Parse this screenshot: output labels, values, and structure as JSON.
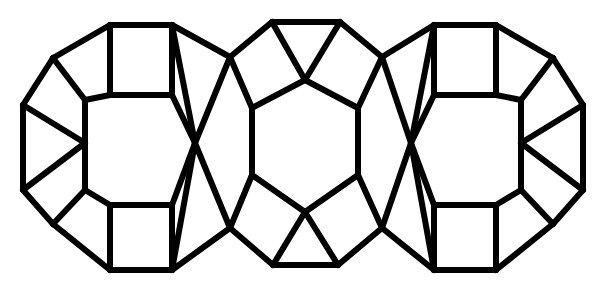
{
  "figure": {
    "width": 606,
    "height": 281,
    "background_color": "#ffffff",
    "stroke_color": "#000000",
    "stroke_width": 6,
    "units_count": 3
  },
  "units": [
    {
      "name": "left-polyhedron",
      "orientation": "upright",
      "center_x": 148,
      "center_y": 140
    },
    {
      "name": "center-polyhedron",
      "orientation": "rotated",
      "center_x": 305,
      "center_y": 140
    },
    {
      "name": "right-polyhedron",
      "orientation": "upright",
      "center_x": 458,
      "center_y": 140
    }
  ],
  "chart_data": {
    "type": "diagram",
    "xlabel": "",
    "ylabel": "",
    "edges": [
      [
        53,
        58,
        110,
        25
      ],
      [
        110,
        25,
        172,
        25
      ],
      [
        172,
        25,
        230,
        57
      ],
      [
        23,
        105,
        53,
        58
      ],
      [
        23,
        105,
        23,
        190
      ],
      [
        23,
        190,
        53,
        224
      ],
      [
        53,
        224,
        110,
        270
      ],
      [
        110,
        270,
        172,
        270
      ],
      [
        172,
        270,
        230,
        228
      ],
      [
        110,
        25,
        110,
        95
      ],
      [
        172,
        25,
        172,
        95
      ],
      [
        110,
        95,
        172,
        95
      ],
      [
        110,
        205,
        172,
        205
      ],
      [
        110,
        205,
        110,
        270
      ],
      [
        172,
        205,
        172,
        270
      ],
      [
        53,
        58,
        85,
        100
      ],
      [
        85,
        100,
        110,
        95
      ],
      [
        85,
        100,
        85,
        190
      ],
      [
        85,
        190,
        110,
        205
      ],
      [
        85,
        190,
        53,
        224
      ],
      [
        23,
        105,
        85,
        143
      ],
      [
        23,
        190,
        85,
        143
      ],
      [
        85,
        100,
        85,
        143
      ],
      [
        85,
        143,
        85,
        190
      ],
      [
        172,
        95,
        195,
        143
      ],
      [
        195,
        143,
        172,
        205
      ],
      [
        172,
        25,
        195,
        143
      ],
      [
        195,
        143,
        172,
        270
      ],
      [
        230,
        57,
        195,
        143
      ],
      [
        195,
        143,
        230,
        228
      ],
      [
        230,
        57,
        252,
        108
      ],
      [
        230,
        228,
        252,
        175
      ],
      [
        272,
        22,
        230,
        57
      ],
      [
        272,
        22,
        340,
        22
      ],
      [
        340,
        22,
        382,
        57
      ],
      [
        273,
        265,
        230,
        228
      ],
      [
        273,
        265,
        338,
        265
      ],
      [
        338,
        265,
        382,
        228
      ],
      [
        272,
        22,
        305,
        80
      ],
      [
        340,
        22,
        305,
        80
      ],
      [
        273,
        265,
        305,
        212
      ],
      [
        338,
        265,
        305,
        212
      ],
      [
        305,
        80,
        252,
        108
      ],
      [
        252,
        108,
        252,
        175
      ],
      [
        252,
        175,
        305,
        212
      ],
      [
        305,
        212,
        358,
        175
      ],
      [
        358,
        175,
        358,
        108
      ],
      [
        358,
        108,
        305,
        80
      ],
      [
        382,
        57,
        358,
        108
      ],
      [
        382,
        228,
        358,
        175
      ],
      [
        411,
        143,
        382,
        57
      ],
      [
        411,
        143,
        382,
        228
      ],
      [
        411,
        143,
        434,
        95
      ],
      [
        411,
        143,
        434,
        205
      ],
      [
        411,
        143,
        434,
        25
      ],
      [
        411,
        143,
        434,
        270
      ],
      [
        434,
        25,
        496,
        25
      ],
      [
        496,
        25,
        553,
        58
      ],
      [
        434,
        270,
        496,
        270
      ],
      [
        496,
        270,
        553,
        224
      ],
      [
        434,
        25,
        434,
        95
      ],
      [
        496,
        25,
        496,
        95
      ],
      [
        434,
        95,
        496,
        95
      ],
      [
        434,
        205,
        496,
        205
      ],
      [
        434,
        205,
        434,
        270
      ],
      [
        496,
        205,
        496,
        270
      ],
      [
        553,
        58,
        583,
        105
      ],
      [
        583,
        105,
        583,
        190
      ],
      [
        583,
        190,
        553,
        224
      ],
      [
        553,
        58,
        521,
        100
      ],
      [
        521,
        100,
        496,
        95
      ],
      [
        521,
        100,
        521,
        190
      ],
      [
        521,
        190,
        496,
        205
      ],
      [
        521,
        190,
        553,
        224
      ],
      [
        583,
        105,
        521,
        143
      ],
      [
        583,
        190,
        521,
        143
      ],
      [
        521,
        100,
        521,
        143
      ],
      [
        521,
        143,
        521,
        190
      ],
      [
        382,
        57,
        434,
        25
      ],
      [
        382,
        228,
        434,
        270
      ]
    ]
  }
}
